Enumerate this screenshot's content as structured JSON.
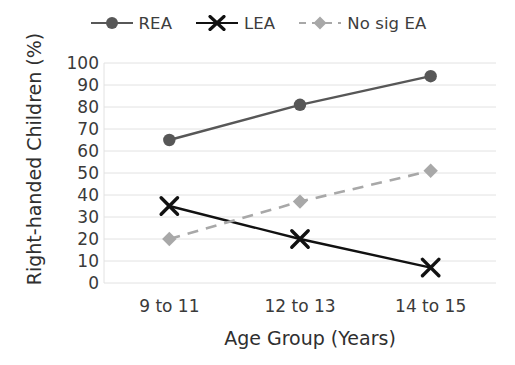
{
  "chart_data": {
    "type": "line",
    "title": "",
    "xlabel": "Age Group (Years)",
    "ylabel": "Right-handed Children (%)",
    "categories": [
      "9 to 11",
      "12 to 13",
      "14 to 15"
    ],
    "ylim": [
      0,
      100
    ],
    "ytick_labels": [
      "0",
      "10",
      "20",
      "30",
      "40",
      "50",
      "60",
      "70",
      "80",
      "90",
      "100"
    ],
    "ytick_values": [
      0,
      10,
      20,
      30,
      40,
      50,
      60,
      70,
      80,
      90,
      100
    ],
    "grid": true,
    "grid_axis": "y",
    "legend_position": "top-center",
    "series": [
      {
        "name": "REA",
        "values": [
          65,
          81,
          94
        ],
        "color": "#575757",
        "marker": "circle",
        "linestyle": "solid"
      },
      {
        "name": "LEA",
        "values": [
          35,
          20,
          7
        ],
        "color": "#111111",
        "marker": "x",
        "linestyle": "solid"
      },
      {
        "name": "No sig EA",
        "values": [
          20,
          37,
          51
        ],
        "color": "#a8a8a8",
        "marker": "diamond",
        "linestyle": "dashed"
      }
    ]
  },
  "colors": {
    "rea": "#575757",
    "lea": "#111111",
    "no_sig_ea": "#a8a8a8",
    "grid": "#e2e2e2",
    "axis_text": "#3a3a3a",
    "background": "#ffffff"
  },
  "legend": {
    "items": [
      {
        "label": "REA",
        "icon": "circle-marker-icon"
      },
      {
        "label": "LEA",
        "icon": "x-marker-icon"
      },
      {
        "label": "No sig EA",
        "icon": "diamond-marker-icon"
      }
    ]
  }
}
